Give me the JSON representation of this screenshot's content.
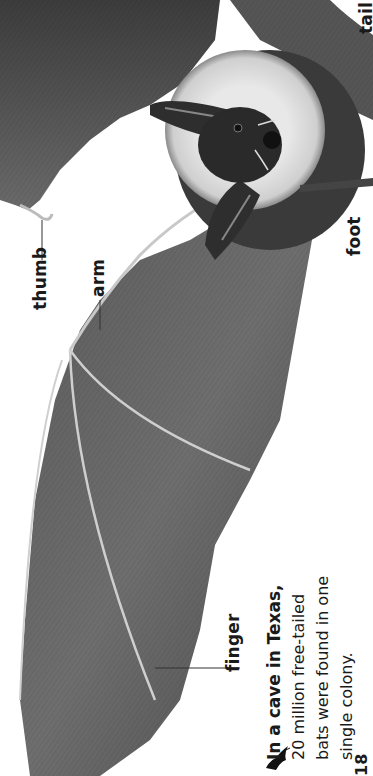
{
  "page": {
    "orientation": "rotated-90-ccw",
    "page_number": "18",
    "background": "#ffffff"
  },
  "illustration": {
    "subject": "bat-with-wings-spread",
    "style": "grayscale-pencil",
    "labels": {
      "thumb": "thumb",
      "arm": "arm",
      "finger": "finger",
      "foot": "foot",
      "tail": "tail"
    }
  },
  "fact_box": {
    "icon": "bat-silhouette-icon",
    "lead": "In a cave in Texas,",
    "line1": "20 million free-tailed",
    "line2": "bats were found in one",
    "line3": "single colony."
  }
}
